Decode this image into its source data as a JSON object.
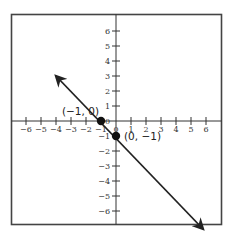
{
  "chart_data": {
    "type": "line",
    "title": "",
    "xlabel": "",
    "ylabel": "",
    "xlim": [
      -7,
      7
    ],
    "ylim": [
      -7,
      7
    ],
    "x_ticks": [
      -6,
      -5,
      -4,
      -3,
      -2,
      -1,
      0,
      1,
      2,
      3,
      4,
      5,
      6
    ],
    "y_ticks": [
      -6,
      -5,
      -4,
      -3,
      -2,
      -1,
      1,
      2,
      3,
      4,
      5,
      6
    ],
    "x_tick_labels": [
      "−6",
      "−5",
      "−4",
      "−3",
      "−2",
      "−1",
      "0",
      "1",
      "2",
      "3",
      "4",
      "5",
      "6"
    ],
    "y_tick_labels": [
      "−6",
      "−5",
      "−4",
      "−3",
      "−2",
      "−1",
      "1",
      "2",
      "3",
      "4",
      "5",
      "6"
    ],
    "grid": false,
    "series": [
      {
        "name": "y = -x - 1",
        "x": [
          -4,
          6
        ],
        "y": [
          3,
          -7
        ],
        "arrows": "both"
      }
    ],
    "points": [
      {
        "x": -1,
        "y": 0,
        "label": "(−1, 0)"
      },
      {
        "x": 0,
        "y": -1,
        "label": "(0, −1)"
      }
    ]
  },
  "labels": {
    "point_a": "(−1, 0)",
    "point_b": "(0, −1)",
    "origin": "0"
  }
}
